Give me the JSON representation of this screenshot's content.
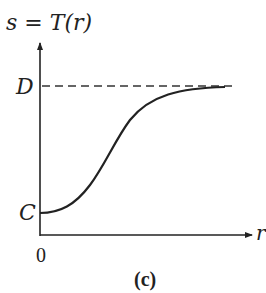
{
  "diagram": {
    "function_label": "s = T(r)",
    "y_axis_label": "s",
    "x_axis_label": "r",
    "origin_label": "0",
    "upper_level_label": "D",
    "lower_level_label": "C",
    "caption": "(c)",
    "curve_type": "sigmoid",
    "colors": {
      "stroke": "#222222",
      "background": "#ffffff"
    }
  }
}
